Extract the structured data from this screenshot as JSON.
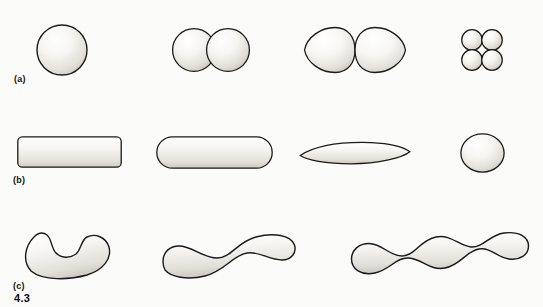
{
  "figure": {
    "number": "4.3",
    "background_color": "#fbfbfa",
    "ink_color": "#1a1a1a",
    "fill_color": "#f2f1ee"
  },
  "rows": [
    {
      "label": "(a)",
      "label_x": 14,
      "label_y": 74,
      "group": "cocci",
      "shapes": [
        {
          "name": "single-coccus",
          "x": 36,
          "y": 24,
          "w": 52,
          "h": 52
        },
        {
          "name": "diplococcus-pair",
          "x": 172,
          "y": 27,
          "w": 78,
          "h": 46
        },
        {
          "name": "lemon-shaped-diplococcus",
          "x": 303,
          "y": 26,
          "w": 104,
          "h": 48
        },
        {
          "name": "coccus-tetrad",
          "x": 461,
          "y": 29,
          "w": 42,
          "h": 42
        }
      ]
    },
    {
      "label": "(b)",
      "label_x": 13,
      "label_y": 175,
      "group": "bacilli",
      "shapes": [
        {
          "name": "square-ended-rod",
          "x": 17,
          "y": 136,
          "w": 105,
          "h": 32
        },
        {
          "name": "round-ended-rod",
          "x": 156,
          "y": 136,
          "w": 117,
          "h": 33
        },
        {
          "name": "fusiform-rod",
          "x": 299,
          "y": 141,
          "w": 112,
          "h": 24
        },
        {
          "name": "coccobacillus",
          "x": 460,
          "y": 133,
          "w": 45,
          "h": 40
        }
      ]
    },
    {
      "label": "(c)",
      "label_x": 13,
      "label_y": 281,
      "group": "spirals",
      "shapes": [
        {
          "name": "vibrio-comma-cell",
          "x": 21,
          "y": 231,
          "w": 92,
          "h": 48
        },
        {
          "name": "spirillum-one-wave",
          "x": 161,
          "y": 231,
          "w": 136,
          "h": 50
        },
        {
          "name": "spirillum-multi-wave",
          "x": 349,
          "y": 226,
          "w": 182,
          "h": 54
        }
      ]
    }
  ],
  "caption": {
    "number": "4.3",
    "number_x": 14,
    "number_y": 292
  }
}
